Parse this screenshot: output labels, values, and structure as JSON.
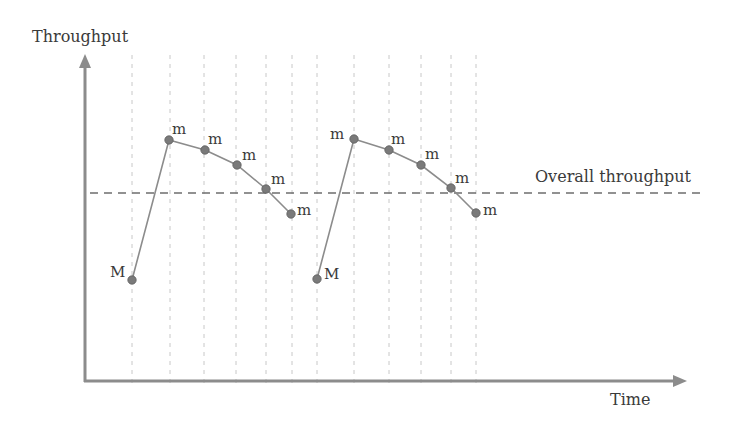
{
  "axes": {
    "y_label": "Throughput",
    "x_label": "Time"
  },
  "reference_line": {
    "label": "Overall throughput",
    "y": 193
  },
  "colors": {
    "axis": "#8c8c8c",
    "line": "#8c8c8c",
    "point": "#7a7a7a",
    "grid": "#c8c8c8",
    "reference": "#6e6e6e",
    "text": "#3a3a3a"
  },
  "grid_x": [
    132,
    170,
    204,
    236,
    266,
    292,
    317,
    354,
    389,
    421,
    451,
    476
  ],
  "series": [
    {
      "name": "cycle-1",
      "points": [
        {
          "x": 132,
          "y": 280,
          "label": "M",
          "lx": -22,
          "ly": -3
        },
        {
          "x": 169,
          "y": 140,
          "label": "m",
          "lx": 3,
          "ly": -6
        },
        {
          "x": 205,
          "y": 150,
          "label": "m",
          "lx": 3,
          "ly": -6
        },
        {
          "x": 237,
          "y": 165,
          "label": "m",
          "lx": 5,
          "ly": -5
        },
        {
          "x": 266,
          "y": 189,
          "label": "m",
          "lx": 5,
          "ly": -5
        },
        {
          "x": 291,
          "y": 214,
          "label": "m",
          "lx": 6,
          "ly": 1
        }
      ]
    },
    {
      "name": "cycle-2",
      "points": [
        {
          "x": 317,
          "y": 279,
          "label": "M",
          "lx": 7,
          "ly": 0
        },
        {
          "x": 354,
          "y": 139,
          "label": "m",
          "lx": -24,
          "ly": 0
        },
        {
          "x": 389,
          "y": 150,
          "label": "m",
          "lx": 2,
          "ly": -6
        },
        {
          "x": 421,
          "y": 165,
          "label": "m",
          "lx": 4,
          "ly": -6
        },
        {
          "x": 451,
          "y": 188,
          "label": "m",
          "lx": 4,
          "ly": -5
        },
        {
          "x": 476,
          "y": 213,
          "label": "m",
          "lx": 7,
          "ly": 2
        }
      ]
    }
  ],
  "chart_data": {
    "type": "line",
    "title": "",
    "xlabel": "Time",
    "ylabel": "Throughput",
    "annotations": [
      "Overall throughput (dashed horizontal reference line)",
      "M = major event (throughput minimum)",
      "m = minor event"
    ],
    "grid": "vertical dashed lines at each event",
    "series": [
      {
        "name": "cycle-1",
        "labels": [
          "M",
          "m",
          "m",
          "m",
          "m",
          "m"
        ],
        "relative_values": [
          0.35,
          0.87,
          0.83,
          0.77,
          0.68,
          0.59
        ]
      },
      {
        "name": "cycle-2",
        "labels": [
          "M",
          "m",
          "m",
          "m",
          "m",
          "m"
        ],
        "relative_values": [
          0.35,
          0.87,
          0.83,
          0.77,
          0.68,
          0.59
        ]
      }
    ],
    "reference_value": 0.67
  }
}
